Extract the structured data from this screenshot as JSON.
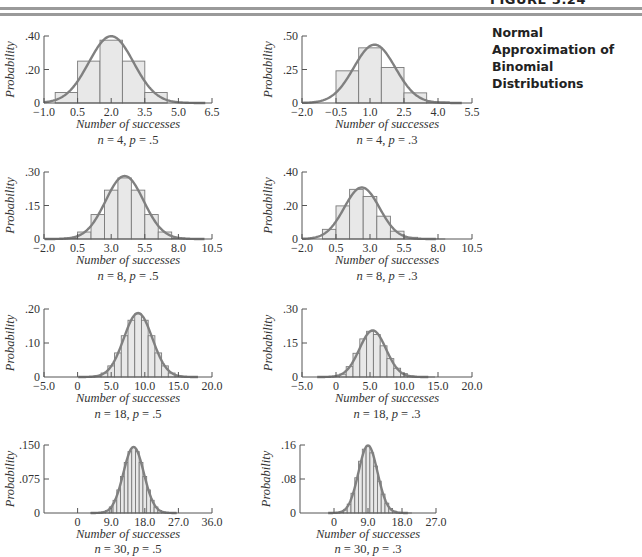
{
  "figure": {
    "label": "FIGURE 5.24",
    "title": "Normal Approximation of Binomial Distributions"
  },
  "style": {
    "bar_fill": "#e8e8e8",
    "bar_stroke": "#7a7a7a",
    "curve_color": "#808080",
    "axis_color": "#555555",
    "rule_color": "#9a9a9a"
  },
  "chart_data": [
    {
      "type": "bar",
      "title": "n = 4, p = .5",
      "n": 4,
      "p": 0.5,
      "xlabel": "Number of successes",
      "ylabel": "Probability",
      "xlim": [
        -1.0,
        6.5
      ],
      "xticks": [
        -1.0,
        0.5,
        2.0,
        3.5,
        5.0,
        6.5
      ],
      "xtick_labels": [
        "−1.0",
        "0.5",
        "2.0",
        "3.5",
        "5.0",
        "6.5"
      ],
      "ylim": [
        0,
        0.4
      ],
      "yticks": [
        0,
        0.2,
        0.4
      ],
      "ytick_labels": [
        "0",
        ".20",
        ".40"
      ],
      "categories": [
        0,
        1,
        2,
        3,
        4
      ],
      "values": [
        0.0625,
        0.25,
        0.375,
        0.25,
        0.0625
      ],
      "overlay": "normal curve"
    },
    {
      "type": "bar",
      "title": "n = 4, p = .3",
      "n": 4,
      "p": 0.3,
      "xlabel": "Number of successes",
      "ylabel": "Probability",
      "xlim": [
        -2.0,
        5.5
      ],
      "xticks": [
        -2.0,
        -0.5,
        1.0,
        2.5,
        4.0,
        5.5
      ],
      "xtick_labels": [
        "−2.0",
        "−0.5",
        "1.0",
        "2.5",
        "4.0",
        "5.5"
      ],
      "ylim": [
        0,
        0.5
      ],
      "yticks": [
        0,
        0.25,
        0.5
      ],
      "ytick_labels": [
        "0",
        ".25",
        ".50"
      ],
      "categories": [
        0,
        1,
        2,
        3,
        4
      ],
      "values": [
        0.2401,
        0.4116,
        0.2646,
        0.0756,
        0.0081
      ],
      "overlay": "normal curve"
    },
    {
      "type": "bar",
      "title": "n = 8, p = .5",
      "n": 8,
      "p": 0.5,
      "xlabel": "Number of successes",
      "ylabel": "Probability",
      "xlim": [
        -2.0,
        10.5
      ],
      "xticks": [
        -2.0,
        0.5,
        3.0,
        5.5,
        8.0,
        10.5
      ],
      "xtick_labels": [
        "−2.0",
        "0.5",
        "3.0",
        "5.5",
        "8.0",
        "10.5"
      ],
      "ylim": [
        0,
        0.3
      ],
      "yticks": [
        0,
        0.15,
        0.3
      ],
      "ytick_labels": [
        "0",
        ".15",
        ".30"
      ],
      "categories": [
        0,
        1,
        2,
        3,
        4,
        5,
        6,
        7,
        8
      ],
      "values": [
        0.0039,
        0.0313,
        0.1094,
        0.2188,
        0.2734,
        0.2188,
        0.1094,
        0.0313,
        0.0039
      ],
      "overlay": "normal curve"
    },
    {
      "type": "bar",
      "title": "n = 8, p = .3",
      "n": 8,
      "p": 0.3,
      "xlabel": "Number of successes",
      "ylabel": "Probability",
      "xlim": [
        -2.0,
        10.5
      ],
      "xticks": [
        -2.0,
        0.5,
        3.0,
        5.5,
        8.0,
        10.5
      ],
      "xtick_labels": [
        "−2.0",
        "0.5",
        "3.0",
        "5.5",
        "8.0",
        "10.5"
      ],
      "ylim": [
        0,
        0.4
      ],
      "yticks": [
        0,
        0.2,
        0.4
      ],
      "ytick_labels": [
        "0",
        ".20",
        ".40"
      ],
      "categories": [
        0,
        1,
        2,
        3,
        4,
        5,
        6,
        7,
        8
      ],
      "values": [
        0.0576,
        0.1977,
        0.2965,
        0.2541,
        0.1361,
        0.0467,
        0.01,
        0.0012,
        0.0001
      ],
      "overlay": "normal curve"
    },
    {
      "type": "bar",
      "title": "n = 18, p = .5",
      "n": 18,
      "p": 0.5,
      "xlabel": "Number of successes",
      "ylabel": "Probability",
      "xlim": [
        -5.0,
        20.0
      ],
      "xticks": [
        -5.0,
        0,
        5.0,
        10.0,
        15.0,
        20.0
      ],
      "xtick_labels": [
        "−5.0",
        "0",
        "5.0",
        "10.0",
        "15.0",
        "20.0"
      ],
      "ylim": [
        0,
        0.2
      ],
      "yticks": [
        0,
        0.1,
        0.2
      ],
      "ytick_labels": [
        "0",
        ".10",
        ".20"
      ],
      "categories": [
        0,
        1,
        2,
        3,
        4,
        5,
        6,
        7,
        8,
        9,
        10,
        11,
        12,
        13,
        14,
        15,
        16,
        17,
        18
      ],
      "values": [
        0.0,
        0.0001,
        0.0006,
        0.0031,
        0.0117,
        0.0327,
        0.0708,
        0.1214,
        0.1669,
        0.1855,
        0.1669,
        0.1214,
        0.0708,
        0.0327,
        0.0117,
        0.0031,
        0.0006,
        0.0001,
        0.0
      ],
      "overlay": "normal curve"
    },
    {
      "type": "bar",
      "title": "n = 18, p = .3",
      "n": 18,
      "p": 0.3,
      "xlabel": "Number of successes",
      "ylabel": "Probability",
      "xlim": [
        -5.0,
        20.0
      ],
      "xticks": [
        -5.0,
        0,
        5.0,
        10.0,
        15.0,
        20.0
      ],
      "xtick_labels": [
        "−5.0",
        "0",
        "5.0",
        "10.0",
        "15.0",
        "20.0"
      ],
      "ylim": [
        0,
        0.3
      ],
      "yticks": [
        0,
        0.15,
        0.3
      ],
      "ytick_labels": [
        "0",
        ".15",
        ".30"
      ],
      "categories": [
        0,
        1,
        2,
        3,
        4,
        5,
        6,
        7,
        8,
        9,
        10,
        11,
        12,
        13,
        14,
        15,
        16,
        17,
        18
      ],
      "values": [
        0.0016,
        0.0126,
        0.0458,
        0.1046,
        0.1681,
        0.2017,
        0.1873,
        0.1376,
        0.0811,
        0.0386,
        0.0149,
        0.0046,
        0.0012,
        0.0002,
        0.0,
        0.0,
        0.0,
        0.0,
        0.0
      ],
      "overlay": "normal curve"
    },
    {
      "type": "bar",
      "title": "n = 30, p = .5",
      "n": 30,
      "p": 0.5,
      "xlabel": "Number of successes",
      "ylabel": "Probability",
      "xlim": [
        -9.0,
        36.0
      ],
      "xticks": [
        0,
        9.0,
        18.0,
        27.0,
        36.0
      ],
      "xtick_labels": [
        "0",
        "9.0",
        "18.0",
        "27.0",
        "36.0"
      ],
      "ylim": [
        0,
        0.15
      ],
      "yticks": [
        0,
        0.075,
        0.15
      ],
      "ytick_labels": [
        "0",
        ".075",
        ".150"
      ],
      "categories": "0..30",
      "values": "binomial(30, .5) pmf, peak ≈ .144 at 15",
      "overlay": "normal curve"
    },
    {
      "type": "bar",
      "title": "n = 30, p = .3",
      "n": 30,
      "p": 0.3,
      "xlabel": "Number of successes",
      "ylabel": "Probability",
      "xlim": [
        -9.0,
        27.0
      ],
      "xticks": [
        0,
        9.0,
        18.0,
        27.0
      ],
      "xtick_labels": [
        "0",
        "9.0",
        "18.0",
        "27.0"
      ],
      "ylim": [
        0,
        0.16
      ],
      "yticks": [
        0,
        0.08,
        0.16
      ],
      "ytick_labels": [
        "0",
        ".08",
        ".16"
      ],
      "categories": "0..30",
      "values": "binomial(30, .3) pmf, peak ≈ .157 at 9",
      "overlay": "normal curve"
    }
  ],
  "layout": {
    "panels": [
      {
        "x0": 44,
        "x1": 212,
        "ytop": 36,
        "ybase": 103,
        "cap_y": 128,
        "sub_y": 144
      },
      {
        "x0": 302,
        "x1": 472,
        "ytop": 36,
        "ybase": 103,
        "cap_y": 128,
        "sub_y": 144
      },
      {
        "x0": 44,
        "x1": 212,
        "ytop": 172,
        "ybase": 239,
        "cap_y": 264,
        "sub_y": 280
      },
      {
        "x0": 302,
        "x1": 472,
        "ytop": 172,
        "ybase": 239,
        "cap_y": 264,
        "sub_y": 280
      },
      {
        "x0": 44,
        "x1": 212,
        "ytop": 309,
        "ybase": 377,
        "cap_y": 402,
        "sub_y": 418
      },
      {
        "x0": 302,
        "x1": 472,
        "ytop": 309,
        "ybase": 377,
        "cap_y": 402,
        "sub_y": 418
      },
      {
        "x0": 44,
        "x1": 212,
        "ytop": 445,
        "ybase": 513,
        "cap_y": 538,
        "sub_y": 553
      },
      {
        "x0": 300,
        "x1": 436,
        "ytop": 445,
        "ybase": 513,
        "cap_y": 538,
        "sub_y": 553
      }
    ]
  }
}
